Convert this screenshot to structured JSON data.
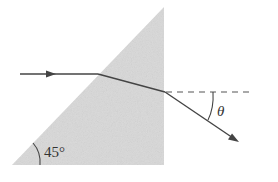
{
  "diagram": {
    "type": "prism-refraction",
    "colors": {
      "background": "#ffffff",
      "prism_fill": "#d9d9d9",
      "ray": "#444444",
      "dashed": "#555555",
      "text": "#333333"
    },
    "prism": {
      "shape": "right-triangle",
      "points": [
        [
          12,
          165
        ],
        [
          164,
          7
        ],
        [
          164,
          165
        ]
      ]
    },
    "rays": {
      "incident": {
        "from": [
          20,
          74
        ],
        "to": [
          98,
          74
        ],
        "arrow_at": [
          52,
          74
        ]
      },
      "refracted_inside": {
        "from": [
          98,
          74
        ],
        "to": [
          165,
          92
        ]
      },
      "emergent": {
        "from": [
          165,
          92
        ],
        "to": [
          238,
          141
        ]
      }
    },
    "normal_line": {
      "from": [
        165,
        92
      ],
      "to": [
        252,
        92
      ],
      "style": "dashed"
    },
    "labels": {
      "apex_angle": "45°",
      "deviation_angle": "θ"
    }
  }
}
